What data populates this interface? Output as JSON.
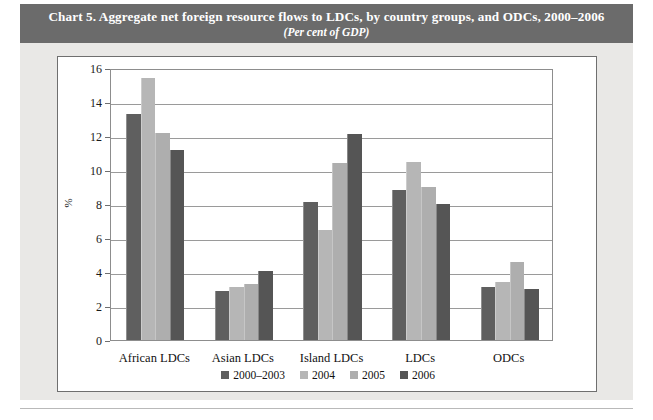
{
  "figure": {
    "title_main": "Chart 5.  Aggregate net foreign resource flows to LDCs, by country groups, and ODCs, 2000–2006",
    "title_sub": "(Per cent of GDP)"
  },
  "colors": {
    "title_band": "#6b6b6b",
    "card_background": "#e9e8e6",
    "panel_background": "#ffffff",
    "gridline": "#9a9a9a",
    "series_2000_2003": "#5f5f5f",
    "series_2004": "#b6b6b6",
    "series_2005": "#aeaeae",
    "series_2006": "#555555"
  },
  "chart_data": {
    "type": "bar",
    "title": "Chart 5.  Aggregate net foreign resource flows to LDCs, by country groups, and ODCs, 2000–2006",
    "subtitle": "(Per cent of GDP)",
    "xlabel": "",
    "ylabel": "%",
    "ylim": [
      0,
      16
    ],
    "ytick_labels": [
      "0",
      "2",
      "4",
      "6",
      "8",
      "10",
      "12",
      "14",
      "16"
    ],
    "ytick_values": [
      0,
      2,
      4,
      6,
      8,
      10,
      12,
      14,
      16
    ],
    "grid": true,
    "legend_position": "bottom",
    "categories": [
      "African LDCs",
      "Asian LDCs",
      "Island LDCs",
      "LDCs",
      "ODCs"
    ],
    "series": [
      {
        "name": "2000–2003",
        "color": "#5f5f5f",
        "values": [
          13.3,
          2.9,
          8.1,
          8.8,
          3.1
        ]
      },
      {
        "name": "2004",
        "color": "#b6b6b6",
        "values": [
          15.4,
          3.1,
          6.5,
          10.5,
          3.4
        ]
      },
      {
        "name": "2005",
        "color": "#aeaeae",
        "values": [
          12.2,
          3.3,
          10.4,
          9.0,
          4.6
        ]
      },
      {
        "name": "2006",
        "color": "#555555",
        "values": [
          11.2,
          4.05,
          12.1,
          8.0,
          3.0
        ]
      }
    ]
  }
}
